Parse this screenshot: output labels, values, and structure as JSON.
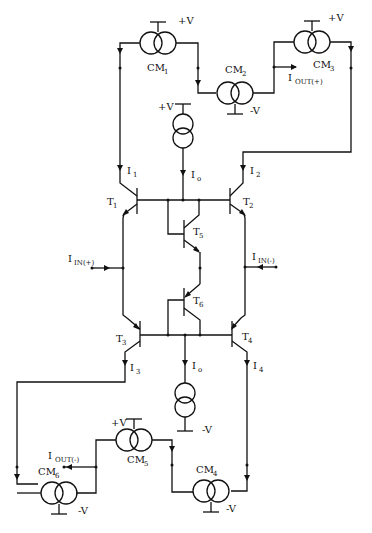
{
  "figure": {
    "type": "circuit-schematic"
  },
  "supplies": {
    "positive": "+V",
    "negative": "-V"
  },
  "current_mirrors": [
    {
      "id": "CM1",
      "name": "CM",
      "sub": "1",
      "supply": "+V"
    },
    {
      "id": "CM2",
      "name": "CM",
      "sub": "2",
      "supply": "-V"
    },
    {
      "id": "CM3",
      "name": "CM",
      "sub": "3",
      "supply": "+V"
    },
    {
      "id": "CM4",
      "name": "CM",
      "sub": "4",
      "supply": "-V"
    },
    {
      "id": "CM5",
      "name": "CM",
      "sub": "5",
      "supply": "+V"
    },
    {
      "id": "CM6",
      "name": "CM",
      "sub": "6",
      "supply": "-V"
    }
  ],
  "transistors": [
    {
      "id": "T1",
      "name": "T",
      "sub": "1"
    },
    {
      "id": "T2",
      "name": "T",
      "sub": "2"
    },
    {
      "id": "T3",
      "name": "T",
      "sub": "3"
    },
    {
      "id": "T4",
      "name": "T",
      "sub": "4"
    },
    {
      "id": "T5",
      "name": "T",
      "sub": "5"
    },
    {
      "id": "T6",
      "name": "T",
      "sub": "6"
    }
  ],
  "currents": [
    {
      "id": "I1",
      "name": "I",
      "sub": "1"
    },
    {
      "id": "I2",
      "name": "I",
      "sub": "2"
    },
    {
      "id": "I3",
      "name": "I",
      "sub": "3"
    },
    {
      "id": "I4",
      "name": "I",
      "sub": "4"
    },
    {
      "id": "Io_top",
      "name": "I",
      "sub": "o"
    },
    {
      "id": "Io_bottom",
      "name": "I",
      "sub": "o"
    }
  ],
  "terminals": {
    "in_plus": {
      "name": "I",
      "sub": "IN(+)"
    },
    "in_minus": {
      "name": "I",
      "sub": "IN(-)"
    },
    "out_plus": {
      "name": "I",
      "sub": "OUT(+)"
    },
    "out_minus": {
      "name": "I",
      "sub": "OUT(-)"
    }
  }
}
